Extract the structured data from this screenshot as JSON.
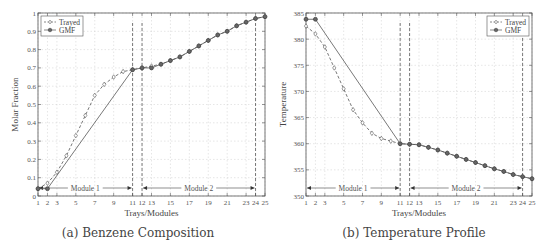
{
  "chart_data": [
    {
      "type": "line",
      "panel": "a",
      "title": "(a) Benzene Composition",
      "caption": "(a) Benzene Composition",
      "xlabel": "Trays/Modules",
      "ylabel": "Molar Fraction",
      "xlim": [
        1,
        25
      ],
      "ylim": [
        0,
        1
      ],
      "xticks": [
        1,
        2,
        3,
        5,
        7,
        9,
        11,
        12,
        13,
        15,
        17,
        19,
        21,
        23,
        24,
        25
      ],
      "yticks": [
        0,
        0.1,
        0.2,
        0.3,
        0.4,
        0.5,
        0.6,
        0.7,
        0.8,
        0.9,
        1
      ],
      "ytick_labels": [
        "0",
        "0.1",
        "0.2",
        "0.3",
        "0.4",
        "0.5",
        "0.6",
        "0.7",
        "0.8",
        "0.9",
        "1"
      ],
      "grid": true,
      "legend_position": "upper left",
      "series": [
        {
          "name": "Trayed",
          "style": "dashed",
          "marker": "diamond",
          "x": [
            1,
            2,
            3,
            4,
            5,
            6,
            7,
            8,
            9,
            10,
            11,
            12,
            13,
            14,
            15,
            16,
            17,
            18,
            19,
            20,
            21,
            22,
            23,
            24,
            25
          ],
          "y": [
            0.04,
            0.07,
            0.13,
            0.22,
            0.33,
            0.44,
            0.55,
            0.61,
            0.65,
            0.68,
            0.69,
            0.7,
            0.71,
            0.72,
            0.74,
            0.76,
            0.79,
            0.82,
            0.85,
            0.88,
            0.9,
            0.93,
            0.95,
            0.97,
            0.98
          ]
        },
        {
          "name": "GMF",
          "style": "solid",
          "marker": "circle",
          "x": [
            1,
            2,
            11,
            12,
            13,
            14,
            15,
            16,
            17,
            18,
            19,
            20,
            21,
            22,
            23,
            24,
            25
          ],
          "y": [
            0.04,
            0.04,
            0.69,
            0.7,
            0.7,
            0.72,
            0.74,
            0.76,
            0.79,
            0.82,
            0.85,
            0.88,
            0.9,
            0.93,
            0.95,
            0.97,
            0.98
          ]
        }
      ],
      "annotations": [
        {
          "text": "Module 1",
          "x_from": 1,
          "x_to": 11
        },
        {
          "text": "Module 2",
          "x_from": 12,
          "x_to": 24
        }
      ],
      "vlines": [
        11,
        12,
        24
      ]
    },
    {
      "type": "line",
      "panel": "b",
      "title": "(b) Temperature Profile",
      "caption": "(b) Temperature Profile",
      "xlabel": "Trays/Modules",
      "ylabel": "Temperature",
      "xlim": [
        1,
        25
      ],
      "ylim": [
        350,
        385
      ],
      "xticks": [
        1,
        2,
        3,
        5,
        7,
        9,
        11,
        12,
        13,
        15,
        17,
        19,
        21,
        23,
        24,
        25
      ],
      "yticks": [
        350,
        355,
        360,
        365,
        370,
        375,
        380,
        385
      ],
      "ytick_labels": [
        "350",
        "355",
        "360",
        "365",
        "370",
        "375",
        "380",
        "385"
      ],
      "grid": true,
      "legend_position": "upper right",
      "series": [
        {
          "name": "Trayed",
          "style": "dashed",
          "marker": "diamond",
          "x": [
            1,
            2,
            3,
            4,
            5,
            6,
            7,
            8,
            9,
            10,
            11,
            12,
            13,
            14,
            15,
            16,
            17,
            18,
            19,
            20,
            21,
            22,
            23,
            24,
            25
          ],
          "y": [
            382.5,
            381,
            378.5,
            374.5,
            370.5,
            366.5,
            364,
            362,
            361,
            360.5,
            360,
            359.9,
            359.8,
            359.3,
            358.8,
            358.2,
            357.6,
            357.0,
            356.4,
            355.8,
            355.2,
            354.7,
            354.1,
            353.7,
            353.3
          ]
        },
        {
          "name": "GMF",
          "style": "solid",
          "marker": "circle",
          "x": [
            1,
            2,
            11,
            12,
            13,
            14,
            15,
            16,
            17,
            18,
            19,
            20,
            21,
            22,
            23,
            24,
            25
          ],
          "y": [
            383.8,
            383.8,
            360,
            359.9,
            359.8,
            359.3,
            358.8,
            358.2,
            357.6,
            357.0,
            356.4,
            355.8,
            355.2,
            354.7,
            354.1,
            353.7,
            353.3
          ]
        }
      ],
      "annotations": [
        {
          "text": "Module 1",
          "x_from": 1,
          "x_to": 11
        },
        {
          "text": "Module 2",
          "x_from": 12,
          "x_to": 24
        }
      ],
      "vlines": [
        11,
        12,
        24
      ]
    }
  ]
}
